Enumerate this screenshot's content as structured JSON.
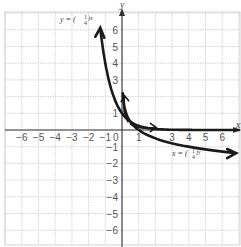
{
  "chart_data": {
    "type": "line",
    "title": "",
    "xlabel": "x",
    "ylabel": "y",
    "xlim": [
      -7,
      7
    ],
    "ylim": [
      -7,
      7
    ],
    "grid": true,
    "x_ticks": [
      -6,
      -5,
      -4,
      -3,
      -2,
      -1,
      1,
      3,
      4,
      5,
      6
    ],
    "y_ticks": [
      6,
      5,
      4,
      3,
      1,
      -1,
      -2,
      -3,
      -4,
      -5,
      -6
    ],
    "origin_label": "0",
    "series": [
      {
        "name": "y = (1/4)^x",
        "label_main": "y = (",
        "label_num": "1",
        "label_den": "4",
        "label_exp": ")x",
        "x": [
          -1.3,
          -1,
          -0.75,
          -0.5,
          -0.25,
          0,
          0.25,
          0.5,
          1,
          1.5,
          2,
          3,
          4,
          5,
          6,
          7
        ],
        "y": [
          6.06,
          4,
          2.83,
          2,
          1.41,
          1,
          0.71,
          0.5,
          0.25,
          0.125,
          0.0625,
          0.0156,
          0.0039,
          0.001,
          0.0002,
          0.0001
        ]
      },
      {
        "name": "x = (1/4)^y",
        "label_main": "x = (",
        "label_num": "1",
        "label_den": "4",
        "label_exp": ")y",
        "x": [
          6.8,
          4,
          2.83,
          2,
          1.41,
          1,
          0.71,
          0.5,
          0.25,
          0.125,
          0.0625
        ],
        "y": [
          -1.38,
          -1,
          -0.75,
          -0.5,
          -0.25,
          0,
          0.25,
          0.5,
          1,
          1.5,
          2
        ]
      }
    ],
    "annotations": [
      "small arrow near (0,1) pointing up",
      "small arrow near (1,0) pointing right"
    ]
  }
}
